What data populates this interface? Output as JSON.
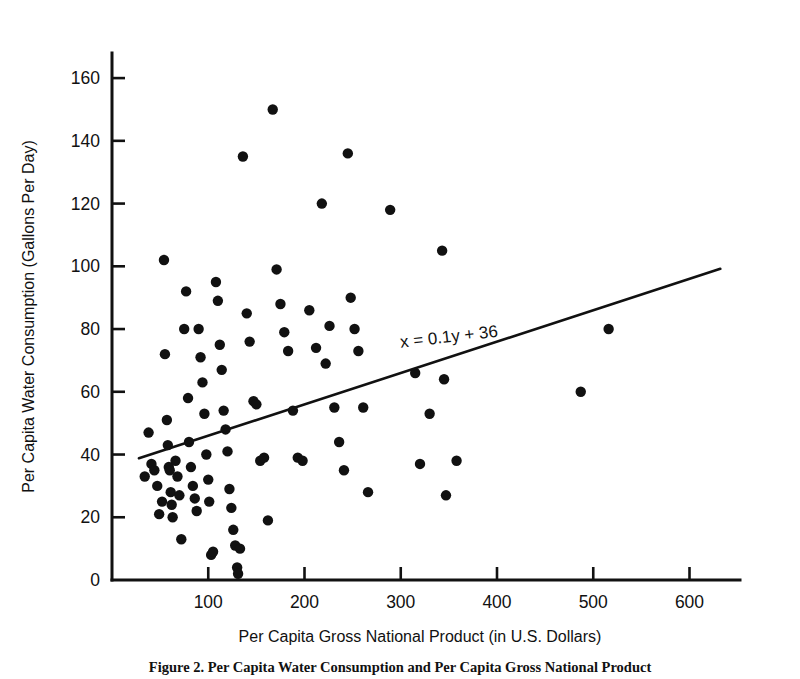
{
  "figure": {
    "background": "#ffffff",
    "ink_color": "#111111",
    "caption": "Figure 2. Per Capita Water Consumption and Per Capita Gross National Product"
  },
  "chart_data": {
    "type": "scatter",
    "title": "",
    "xlabel": "Per Capita Gross National Product (in U.S. Dollars)",
    "ylabel": "Per Capita Water Consumption (Gallons Per Day)",
    "xlim": [
      0,
      640
    ],
    "ylim": [
      0,
      168
    ],
    "xticks": [
      100,
      200,
      300,
      400,
      500,
      600
    ],
    "yticks": [
      0,
      20,
      40,
      60,
      80,
      100,
      120,
      140,
      160
    ],
    "xtick_labels": [
      "100",
      "200",
      "300",
      "400",
      "500",
      "600"
    ],
    "ytick_labels": [
      "0",
      "20",
      "40",
      "60",
      "80",
      "100",
      "120",
      "140",
      "160"
    ],
    "grid": false,
    "legend": null,
    "marker": {
      "shape": "circle",
      "color": "#111111",
      "size_px": 5.2
    },
    "annotations": [
      {
        "text": "x = 0.1y + 36",
        "x": 300,
        "y": 74,
        "rotation_deg": -6.6,
        "role": "regression-equation"
      }
    ],
    "fit_line": {
      "equation": "x = 0.1y + 36",
      "slope": 0.1,
      "intercept": 36,
      "x_start": 28,
      "y_start": 38.8,
      "x_end": 632,
      "y_end": 99.2,
      "color": "#111111"
    },
    "points": [
      [
        34,
        33
      ],
      [
        38,
        47
      ],
      [
        41,
        37
      ],
      [
        44,
        35
      ],
      [
        47,
        30
      ],
      [
        49,
        21
      ],
      [
        52,
        25
      ],
      [
        54,
        102
      ],
      [
        55,
        72
      ],
      [
        57,
        51
      ],
      [
        58,
        43
      ],
      [
        59,
        36
      ],
      [
        60,
        35
      ],
      [
        61,
        28
      ],
      [
        62,
        24
      ],
      [
        63,
        20
      ],
      [
        66,
        38
      ],
      [
        68,
        33
      ],
      [
        70,
        27
      ],
      [
        72,
        13
      ],
      [
        75,
        80
      ],
      [
        77,
        92
      ],
      [
        79,
        58
      ],
      [
        80,
        44
      ],
      [
        82,
        36
      ],
      [
        84,
        30
      ],
      [
        86,
        26
      ],
      [
        88,
        22
      ],
      [
        90,
        80
      ],
      [
        92,
        71
      ],
      [
        94,
        63
      ],
      [
        96,
        53
      ],
      [
        98,
        40
      ],
      [
        100,
        32
      ],
      [
        101,
        25
      ],
      [
        103,
        8
      ],
      [
        105,
        9
      ],
      [
        108,
        95
      ],
      [
        110,
        89
      ],
      [
        112,
        75
      ],
      [
        114,
        67
      ],
      [
        116,
        54
      ],
      [
        118,
        48
      ],
      [
        120,
        41
      ],
      [
        122,
        29
      ],
      [
        124,
        23
      ],
      [
        126,
        16
      ],
      [
        128,
        11
      ],
      [
        130,
        4
      ],
      [
        131,
        2
      ],
      [
        133,
        10
      ],
      [
        136,
        135
      ],
      [
        140,
        85
      ],
      [
        143,
        76
      ],
      [
        147,
        57
      ],
      [
        150,
        56
      ],
      [
        154,
        38
      ],
      [
        158,
        39
      ],
      [
        162,
        19
      ],
      [
        167,
        150
      ],
      [
        171,
        99
      ],
      [
        175,
        88
      ],
      [
        179,
        79
      ],
      [
        183,
        73
      ],
      [
        188,
        54
      ],
      [
        193,
        39
      ],
      [
        198,
        38
      ],
      [
        205,
        86
      ],
      [
        212,
        74
      ],
      [
        218,
        120
      ],
      [
        222,
        69
      ],
      [
        226,
        81
      ],
      [
        231,
        55
      ],
      [
        236,
        44
      ],
      [
        241,
        35
      ],
      [
        245,
        136
      ],
      [
        248,
        90
      ],
      [
        252,
        80
      ],
      [
        256,
        73
      ],
      [
        261,
        55
      ],
      [
        266,
        28
      ],
      [
        289,
        118
      ],
      [
        315,
        66
      ],
      [
        320,
        37
      ],
      [
        330,
        53
      ],
      [
        343,
        105
      ],
      [
        345,
        64
      ],
      [
        347,
        27
      ],
      [
        358,
        38
      ],
      [
        487,
        60
      ],
      [
        516,
        80
      ]
    ]
  }
}
